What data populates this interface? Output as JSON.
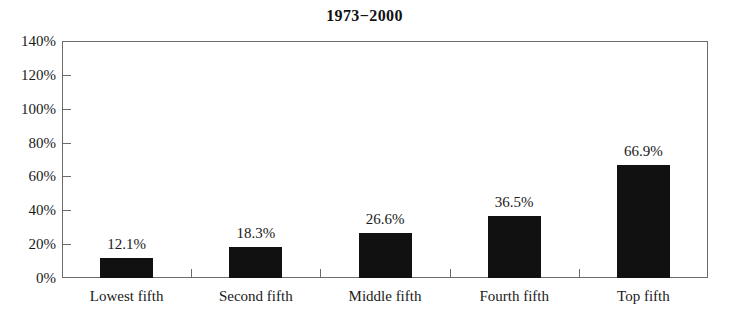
{
  "chart_data": {
    "type": "bar",
    "title": "1973−2000",
    "xlabel": "",
    "ylabel": "",
    "categories": [
      "Lowest fifth",
      "Second fifth",
      "Middle fifth",
      "Fourth fifth",
      "Top fifth"
    ],
    "values": [
      12.1,
      18.3,
      26.6,
      36.5,
      66.9
    ],
    "value_labels": [
      "12.1%",
      "18.3%",
      "26.6%",
      "36.5%",
      "66.9%"
    ],
    "ylim": [
      0,
      140
    ],
    "ytick_values": [
      0,
      20,
      40,
      60,
      80,
      100,
      120,
      140
    ],
    "ytick_labels": [
      "0%",
      "20%",
      "40%",
      "60%",
      "80%",
      "100%",
      "120%",
      "140%"
    ],
    "grid": false,
    "legend": false,
    "legend_position": "none",
    "bar_color": "#111111",
    "frame_color": "#6b6b6b",
    "background_color": "#ffffff",
    "text_color": "#1a1a1a"
  }
}
